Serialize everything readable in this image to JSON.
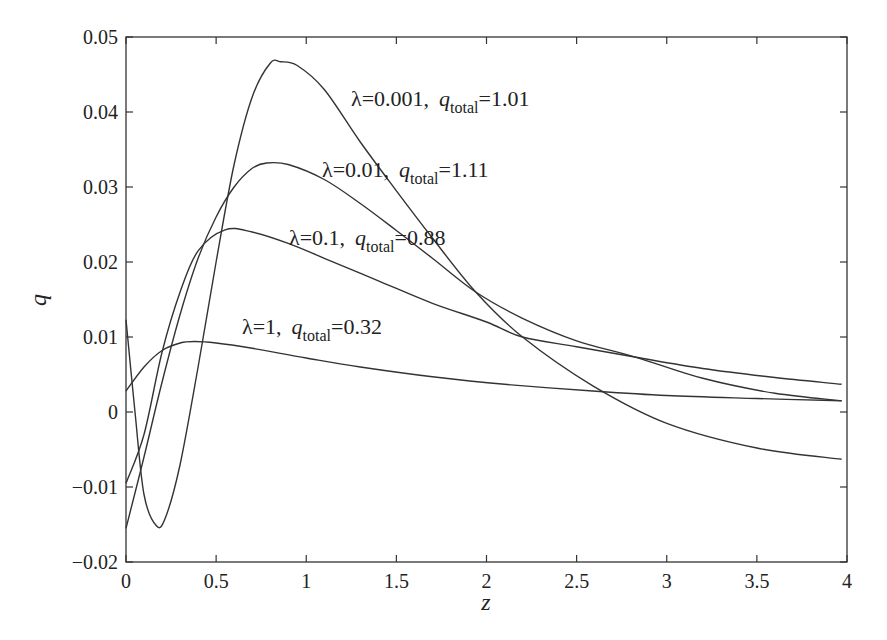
{
  "chart_data": {
    "type": "line",
    "title": "",
    "xlabel": "z",
    "ylabel": "q",
    "xlim": [
      0,
      4
    ],
    "ylim": [
      -0.02,
      0.05
    ],
    "xticks": [
      "0",
      "0.5",
      "1",
      "1.5",
      "2",
      "2.5",
      "3",
      "3.5",
      "4"
    ],
    "yticks": [
      "−0.02",
      "−0.01",
      "0",
      "0.01",
      "0.02",
      "0.03",
      "0.04",
      "0.05"
    ],
    "grid": false,
    "legend": "none (inline annotations)",
    "series": [
      {
        "name": "λ=0.001",
        "q_total": "1.01",
        "x": [
          0,
          0.05,
          0.1,
          0.17,
          0.22,
          0.3,
          0.4,
          0.5,
          0.6,
          0.7,
          0.8,
          0.86,
          0.95,
          1.1,
          1.3,
          1.5,
          1.7,
          1.94,
          2.2,
          2.59,
          3.0,
          3.5,
          3.97
        ],
        "values": [
          0.0123,
          0.0,
          -0.011,
          -0.0152,
          -0.014,
          -0.007,
          0.006,
          0.02,
          0.033,
          0.042,
          0.0465,
          0.0467,
          0.0462,
          0.043,
          0.036,
          0.0295,
          0.0232,
          0.016,
          0.01,
          0.0035,
          -0.0015,
          -0.0048,
          -0.0063
        ]
      },
      {
        "name": "λ=0.01",
        "q_total": "1.11",
        "x": [
          0,
          0.1,
          0.2,
          0.3,
          0.4,
          0.5,
          0.6,
          0.7,
          0.78,
          0.9,
          1.1,
          1.3,
          1.5,
          1.7,
          1.94,
          2.2,
          2.5,
          2.83,
          3.2,
          3.6,
          3.97
        ],
        "values": [
          -0.0155,
          -0.006,
          0.004,
          0.013,
          0.0205,
          0.026,
          0.03,
          0.0325,
          0.0332,
          0.033,
          0.031,
          0.0278,
          0.0242,
          0.0205,
          0.016,
          0.0125,
          0.0095,
          0.0073,
          0.0045,
          0.0025,
          0.0015
        ]
      },
      {
        "name": "λ=0.1",
        "q_total": "0.88",
        "x": [
          0,
          0.1,
          0.2,
          0.3,
          0.4,
          0.55,
          0.7,
          0.9,
          1.1,
          1.4,
          1.7,
          2.0,
          2.2,
          2.5,
          2.83,
          3.2,
          3.6,
          3.97
        ],
        "values": [
          -0.0095,
          -0.003,
          0.008,
          0.016,
          0.0215,
          0.0243,
          0.024,
          0.0225,
          0.0205,
          0.0175,
          0.0145,
          0.012,
          0.01,
          0.0087,
          0.0073,
          0.0058,
          0.0046,
          0.0037
        ]
      },
      {
        "name": "λ=1",
        "q_total": "0.32",
        "x": [
          0,
          0.1,
          0.2,
          0.3,
          0.38,
          0.5,
          0.7,
          1.0,
          1.3,
          1.7,
          2.1,
          2.59,
          3.0,
          3.5,
          3.97
        ],
        "values": [
          0.0028,
          0.006,
          0.0082,
          0.0092,
          0.0094,
          0.0092,
          0.0085,
          0.0072,
          0.006,
          0.0047,
          0.0037,
          0.0028,
          0.0022,
          0.0018,
          0.0015
        ]
      }
    ],
    "annotations": [
      {
        "lambda": "λ=0.001,",
        "q": "q",
        "sub": "total",
        "value": "=1.01"
      },
      {
        "lambda": "λ=0.01,",
        "q": "q",
        "sub": "total",
        "value": "=1.11"
      },
      {
        "lambda": "λ=0.1,",
        "q": "q",
        "sub": "total",
        "value": "=0.88"
      },
      {
        "lambda": "λ=1,",
        "q": "q",
        "sub": "total",
        "value": "=0.32"
      }
    ],
    "colors": {
      "line": "#333333",
      "axis": "#333333",
      "background": "#ffffff"
    }
  }
}
